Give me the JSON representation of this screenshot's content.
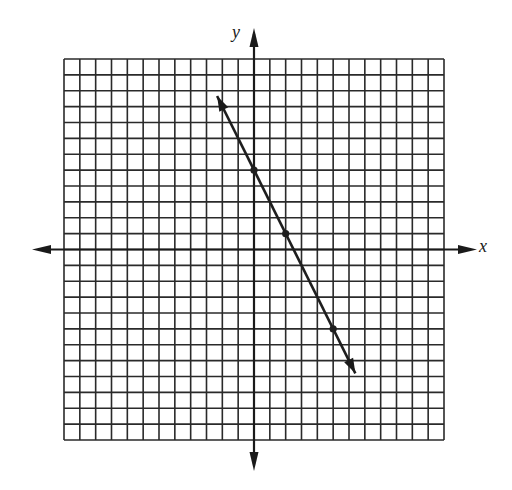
{
  "chart_data": {
    "type": "line",
    "title": "",
    "xlabel": "x",
    "ylabel": "y",
    "xlim": [
      -12,
      12
    ],
    "ylim": [
      -12,
      12
    ],
    "grid": true,
    "grid_step": 1,
    "legend": null,
    "series": [
      {
        "name": "line",
        "equation": "y = -2x + 5",
        "slope": -2,
        "intercept": 5,
        "marked_points": [
          {
            "x": 0,
            "y": 5
          },
          {
            "x": 2,
            "y": 1
          },
          {
            "x": 5,
            "y": -5
          }
        ],
        "arrow_ends": [
          {
            "x": -2.33,
            "y": 9.67
          },
          {
            "x": 6.4,
            "y": -7.8
          }
        ]
      }
    ]
  },
  "labels": {
    "x_axis": "x",
    "y_axis": "y"
  },
  "colors": {
    "grid": "#2a2a2a",
    "axes": "#1a1a1a",
    "line": "#1e1e1e",
    "background": "#ffffff"
  }
}
